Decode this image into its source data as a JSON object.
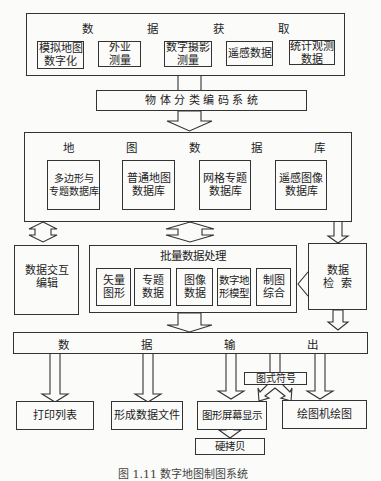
{
  "acquisition": {
    "title_chars": [
      "数",
      "据",
      "获",
      "取"
    ],
    "title": "数据获取",
    "items": [
      {
        "line1": "模拟地图",
        "line2": "数字化"
      },
      {
        "line1": "外业",
        "line2": "测量"
      },
      {
        "line1": "数字摄影",
        "line2": "测量"
      },
      {
        "line1": "遥感数据",
        "line2": ""
      },
      {
        "line1": "统计观测",
        "line2": "数据"
      }
    ]
  },
  "coding": {
    "label": "物 体 分 类 编 码 系 统"
  },
  "database": {
    "title_chars": [
      "地",
      "图",
      "数",
      "据",
      "库"
    ],
    "title": "地图数据库",
    "items": [
      {
        "line1": "多边形与",
        "line2": "专题数据库"
      },
      {
        "line1": "普通地图",
        "line2": "数据库"
      },
      {
        "line1": "网格专题",
        "line2": "数据库"
      },
      {
        "line1": "遥感图像",
        "line2": "数据库"
      }
    ]
  },
  "interactive_edit": {
    "line1": "数据交互",
    "line2": "编辑"
  },
  "batch": {
    "title": "批量数据处理",
    "items": [
      {
        "line1": "矢量",
        "line2": "图形"
      },
      {
        "line1": "专题",
        "line2": "数据"
      },
      {
        "line1": "图像",
        "line2": "数据"
      },
      {
        "line1": "数字地",
        "line2": "形模型"
      },
      {
        "line1": "制图",
        "line2": "综合"
      }
    ]
  },
  "retrieval": {
    "line1": "数据",
    "line2": "检  索"
  },
  "output": {
    "title_chars": [
      "数",
      "据",
      "输",
      "出"
    ],
    "title": "数据输出"
  },
  "symbols": {
    "label": "图式符号"
  },
  "outputs": {
    "print": "打印列表",
    "file": "形成数据文件",
    "screen": "图形屏幕显示",
    "plotter": "绘图机绘图",
    "hardcopy": "硬拷贝"
  },
  "caption": "图 1.11  数字地图制图系统"
}
